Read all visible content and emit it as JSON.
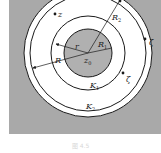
{
  "diagram": {
    "colors": {
      "background": "#aaaaaa",
      "inner_disk": "#b0b0b0",
      "annulus": "#ffffff",
      "stroke": "#1a1a1a"
    },
    "labels": {
      "center": "z",
      "center_sub": "0",
      "point_z": "z",
      "zeta_outer": "ζ",
      "zeta_inner": "ζ",
      "r": "r",
      "R": "R",
      "R1": "R",
      "R1_sub": "1",
      "R2": "R",
      "R2_sub": "2",
      "K1": "K",
      "K1_sub": "1",
      "K2": "K",
      "K2_sub": "2"
    }
  },
  "caption": "图 4.5"
}
